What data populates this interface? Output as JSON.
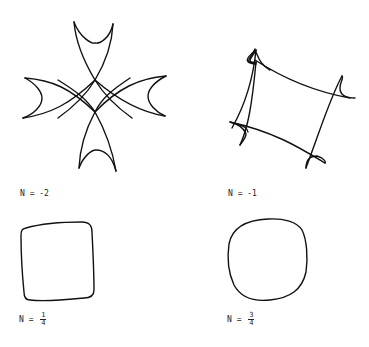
{
  "figures": [
    {
      "id": "n-minus-2",
      "label_prefix": "N = ",
      "label_value": "-2",
      "shape": "four-lobed curve with cusps"
    },
    {
      "id": "n-minus-1",
      "label_prefix": "N = ",
      "label_value": "-1",
      "shape": "four-cusped astroid-like curve"
    },
    {
      "id": "n-one-quarter",
      "label_prefix": "N = ",
      "numerator": "1",
      "denominator": "4",
      "shape": "rounded square"
    },
    {
      "id": "n-three-quarters",
      "label_prefix": "N = ",
      "numerator": "3",
      "denominator": "4",
      "shape": "rounded blob"
    }
  ],
  "stroke_color": "#111111"
}
